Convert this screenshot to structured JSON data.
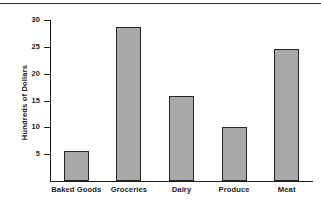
{
  "chart_data": {
    "type": "bar",
    "title": "",
    "xlabel": "",
    "ylabel": "Hundreds of Dollars",
    "categories": [
      "Baked Goods",
      "Groceries",
      "Dairy",
      "Produce",
      "Meat"
    ],
    "values": [
      5.5,
      28.7,
      15.8,
      10.0,
      24.6
    ],
    "ylim": [
      0,
      30
    ],
    "yticks": [
      5,
      10,
      15,
      20,
      25,
      30
    ],
    "ytick_labels": [
      "5",
      "10",
      "15",
      "20",
      "25",
      "30"
    ],
    "grid": false,
    "legend": false,
    "bar_color": "#a9a9a9",
    "bar_edge_color": "#262626",
    "axis_color": "#1d1d1d",
    "background_color": "#ffffff"
  },
  "decor": {
    "top_rule": true
  }
}
